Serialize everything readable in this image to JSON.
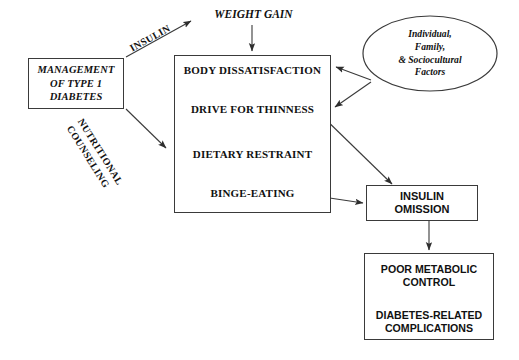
{
  "diagram": {
    "background_color": "#ffffff",
    "line_color": "#3a3a3a",
    "text_color": "#111111"
  },
  "nodes": {
    "management": {
      "name": "management-of-type-1-diabetes",
      "lines": [
        "MANAGEMENT",
        "OF TYPE 1",
        "DIABETES"
      ],
      "shape": "rectangle"
    },
    "weight_gain": {
      "name": "weight-gain",
      "label": "WEIGHT GAIN",
      "shape": "text"
    },
    "core": {
      "name": "eating-pathology-cluster",
      "shape": "rectangle",
      "items": [
        "BODY DISSATISFACTION",
        "DRIVE FOR THINNESS",
        "DIETARY RESTRAINT",
        "BINGE-EATING"
      ]
    },
    "factors": {
      "name": "individual-family-sociocultural-factors",
      "shape": "ellipse",
      "lines": [
        "Individual,",
        "Family,",
        "& Sociocultural",
        "Factors"
      ]
    },
    "insulin_omission": {
      "name": "insulin-omission",
      "shape": "rectangle",
      "lines": [
        "INSULIN",
        "OMISSION"
      ]
    },
    "outcomes": {
      "name": "diabetes-outcomes",
      "shape": "rectangle",
      "items": [
        [
          "POOR METABOLIC",
          "CONTROL"
        ],
        [
          "DIABETES-RELATED",
          "COMPLICATIONS"
        ]
      ]
    }
  },
  "edge_labels": {
    "insulin": "INSULIN",
    "nutritional_counseling": [
      "NUTRITIONAL",
      "COUNSELING"
    ]
  }
}
